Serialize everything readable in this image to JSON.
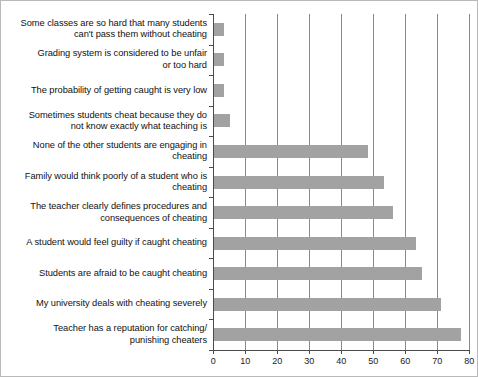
{
  "chart_data": {
    "type": "bar",
    "orientation": "horizontal",
    "title": "",
    "subtitle": "",
    "xlabel": "",
    "ylabel": "",
    "xlim": [
      0,
      80
    ],
    "xticks": [
      0,
      10,
      20,
      30,
      40,
      50,
      60,
      70,
      80
    ],
    "grid": "vertical",
    "legend": "none",
    "bar_color": "#a2a2a2",
    "axis_color": "#4a4a4a",
    "gridline_color": "#8a8a8a",
    "categories": [
      "Some classes are so hard that many students can't pass them without cheating",
      "Grading system is considered to be unfair or too hard",
      "The probability of getting caught is very low",
      "Sometimes students cheat because they do not know exactly what teaching is",
      "None of the other students are engaging in cheating",
      "Family would think poorly of a student who is cheating",
      "The teacher clearly defines  procedures and consequences of cheating",
      "A student would feel guilty if caught cheating",
      "Students are afraid to be caught cheating",
      "My university deals with cheating severely",
      "Teacher has a reputation for catching/ punishing cheaters"
    ],
    "category_lines": [
      [
        "Some classes are so hard that many students",
        "can't pass them without cheating"
      ],
      [
        "Grading system is considered to be unfair",
        "or too hard"
      ],
      [
        "The probability of getting caught is very low"
      ],
      [
        "Sometimes students cheat because they do",
        "not know exactly what teaching is"
      ],
      [
        "None of the other students are engaging in",
        "cheating"
      ],
      [
        "Family would think poorly of a student who is",
        "cheating"
      ],
      [
        "The teacher clearly defines  procedures and",
        "consequences of cheating"
      ],
      [
        "A student would feel guilty if caught cheating"
      ],
      [
        "Students are afraid to be caught cheating"
      ],
      [
        "My university deals with cheating severely"
      ],
      [
        "Teacher has a reputation for catching/",
        "punishing cheaters"
      ]
    ],
    "values": [
      3,
      3,
      3,
      5,
      48,
      53,
      56,
      63,
      65,
      71,
      77
    ]
  }
}
